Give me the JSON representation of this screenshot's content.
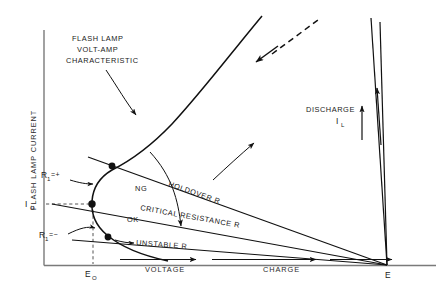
{
  "figure": {
    "title_annotation": {
      "line1": "FLASH LAMP",
      "line2": "VOLT-AMP",
      "line3": "CHARACTERISTIC"
    },
    "axes": {
      "y_label": "FLASH LAMP CURRENT",
      "x_label_left": "VOLTAGE",
      "x_label_right": "CHARGE",
      "x_origin_tick": "E",
      "x_origin_tick_sub": "O",
      "y_origin_tick": "I",
      "y_origin_tick_sub": "O",
      "right_endpoint": "E"
    },
    "load_lines": [
      {
        "name": "holdover",
        "label": "HOLDOVER R"
      },
      {
        "name": "critical",
        "label": "CRITICAL RESISTANCE  R"
      },
      {
        "name": "unstable",
        "label": "UNSTABLE  R"
      }
    ],
    "region_markers": {
      "upper": "NG",
      "lower": "OK"
    },
    "resistance_markers": [
      {
        "name": "r1-positive",
        "base": "R",
        "sub": "1",
        "relation": "=+"
      },
      {
        "name": "r1-negative",
        "base": "R",
        "sub": "1",
        "relation": "=−"
      }
    ],
    "discharge": {
      "label": "DISCHARGE",
      "current_base": "I",
      "current_sub": "L"
    },
    "colors": {
      "ink": "#111111",
      "axis": "#7a7a7a",
      "dashed": "#555555",
      "background": "#ffffff"
    }
  }
}
